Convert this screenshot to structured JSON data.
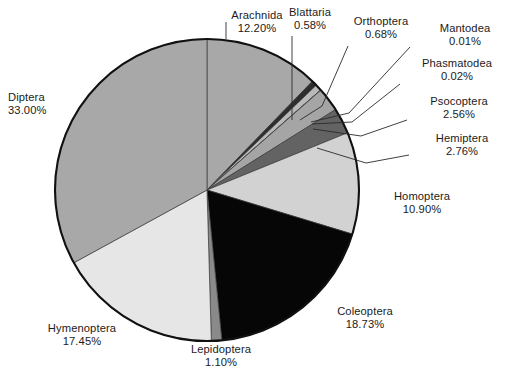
{
  "chart_data": {
    "type": "pie",
    "title": "",
    "subtitle": "",
    "xlabel": "",
    "ylabel": "",
    "legend_position": "none",
    "grid": false,
    "units": "percent",
    "value_suffix": "%",
    "start_angle_deg": 0,
    "direction": "clockwise",
    "total": 100.19,
    "categories": [
      "Arachnida",
      "Blattaria",
      "Orthoptera",
      "Mantodea",
      "Phasmatodea",
      "Psocoptera",
      "Hemiptera",
      "Homoptera",
      "Coleoptera",
      "Lepidoptera",
      "Hymenoptera",
      "Diptera"
    ],
    "values": [
      12.2,
      0.58,
      0.68,
      0.01,
      0.02,
      2.56,
      2.76,
      10.9,
      18.73,
      1.1,
      17.45,
      33.0
    ],
    "value_labels": [
      "12.20%",
      "0.58%",
      "0.68%",
      "0.01%",
      "0.02%",
      "2.56%",
      "2.76%",
      "10.90%",
      "18.73%",
      "1.10%",
      "17.45%",
      "33.00%"
    ],
    "colors": [
      "#a8a8a8",
      "#2d2d2d",
      "#b9b9b9",
      "#111111",
      "#f2f2f2",
      "#a5a5a5",
      "#636363",
      "#d2d2d2",
      "#060606",
      "#8a8a8a",
      "#e6e6e6",
      "#a8a8a8"
    ],
    "slices": [
      {
        "name": "Arachnida",
        "value": 12.2,
        "label": "12.20%",
        "color": "#a8a8a8"
      },
      {
        "name": "Blattaria",
        "value": 0.58,
        "label": "0.58%",
        "color": "#2d2d2d"
      },
      {
        "name": "Orthoptera",
        "value": 0.68,
        "label": "0.68%",
        "color": "#b9b9b9"
      },
      {
        "name": "Mantodea",
        "value": 0.01,
        "label": "0.01%",
        "color": "#111111"
      },
      {
        "name": "Phasmatodea",
        "value": 0.02,
        "label": "0.02%",
        "color": "#f2f2f2"
      },
      {
        "name": "Psocoptera",
        "value": 2.56,
        "label": "2.56%",
        "color": "#a5a5a5"
      },
      {
        "name": "Hemiptera",
        "value": 2.76,
        "label": "2.76%",
        "color": "#636363"
      },
      {
        "name": "Homoptera",
        "value": 10.9,
        "label": "10.90%",
        "color": "#d2d2d2"
      },
      {
        "name": "Coleoptera",
        "value": 18.73,
        "label": "18.73%",
        "color": "#060606"
      },
      {
        "name": "Lepidoptera",
        "value": 1.1,
        "label": "1.10%",
        "color": "#8a8a8a"
      },
      {
        "name": "Hymenoptera",
        "value": 17.45,
        "label": "17.45%",
        "color": "#e6e6e6"
      },
      {
        "name": "Diptera",
        "value": 33.0,
        "label": "33.00%",
        "color": "#a8a8a8"
      }
    ]
  },
  "geometry": {
    "cx": 207,
    "cy": 190,
    "rx": 152,
    "ry": 151,
    "outline_color": "#111111"
  },
  "labels": [
    {
      "key": "arachnida",
      "name": "Arachnida",
      "value": "12.20%",
      "x": 197,
      "y": 9,
      "align": "center",
      "w": 120
    },
    {
      "key": "blattaria",
      "name": "Blattaria",
      "value": "0.58%",
      "x": 275,
      "y": 6,
      "align": "center",
      "w": 70
    },
    {
      "key": "orthoptera",
      "name": "Orthoptera",
      "value": "0.68%",
      "x": 340,
      "y": 15,
      "align": "center",
      "w": 82
    },
    {
      "key": "mantodea",
      "name": "Mantodea",
      "value": "0.01%",
      "x": 426,
      "y": 22,
      "align": "center",
      "w": 78
    },
    {
      "key": "phasmatodea",
      "name": "Phasmatodea",
      "value": "0.02%",
      "x": 410,
      "y": 57,
      "align": "center",
      "w": 94
    },
    {
      "key": "psocoptera",
      "name": "Psocoptera",
      "value": "2.56%",
      "x": 414,
      "y": 95,
      "align": "center",
      "w": 90
    },
    {
      "key": "hemiptera",
      "name": "Hemiptera",
      "value": "2.76%",
      "x": 420,
      "y": 132,
      "align": "center",
      "w": 84
    },
    {
      "key": "homoptera",
      "name": "Homoptera",
      "value": "10.90%",
      "x": 380,
      "y": 190,
      "align": "center",
      "w": 84
    },
    {
      "key": "coleoptera",
      "name": "Coleoptera",
      "value": "18.73%",
      "x": 323,
      "y": 305,
      "align": "center",
      "w": 84
    },
    {
      "key": "lepidoptera",
      "name": "Lepidoptera",
      "value": "1.10%",
      "x": 177,
      "y": 343,
      "align": "center",
      "w": 88
    },
    {
      "key": "hymenoptera",
      "name": "Hymenoptera",
      "value": "17.45%",
      "x": 27,
      "y": 322,
      "align": "center",
      "w": 110
    },
    {
      "key": "diptera",
      "name": "Diptera",
      "value": "33.00%",
      "x": 8,
      "y": 91,
      "align": "left",
      "w": 70
    }
  ],
  "leader_lines": [
    {
      "key": "arachnida",
      "points": "226,39 226,22"
    },
    {
      "key": "blattaria",
      "points": "292,120 292,36"
    },
    {
      "key": "orthoptera",
      "points": "300,120 322,106 348,46"
    },
    {
      "key": "mantodea",
      "points": "311,122 349,113 410,47"
    },
    {
      "key": "phasmatodea",
      "points": "312,124 352,122 400,84"
    },
    {
      "key": "psocoptera",
      "points": "313,129 361,136 407,120"
    },
    {
      "key": "hemiptera",
      "points": "317,148 366,163 409,155"
    }
  ]
}
